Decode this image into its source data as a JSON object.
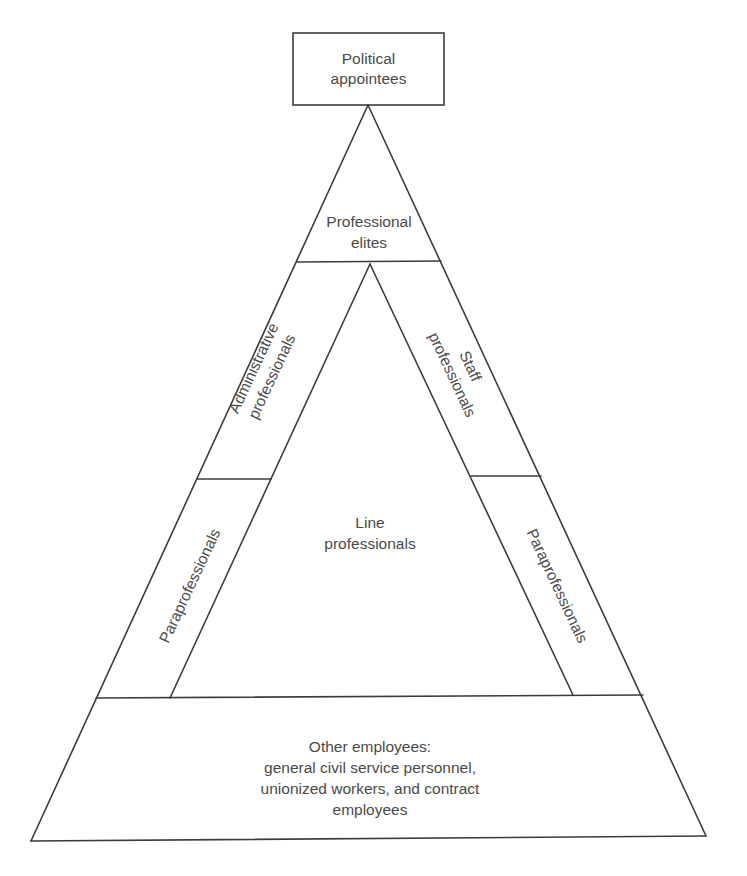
{
  "diagram": {
    "type": "hierarchy-pyramid",
    "colors": {
      "line": "#3c3c3c",
      "text": "#4a4a4a",
      "background": "#ffffff"
    },
    "top_box": {
      "lines": [
        "Political",
        "appointees"
      ]
    },
    "professional_elites": {
      "lines": [
        "Professional",
        "elites"
      ]
    },
    "administrative_professionals": {
      "lines": [
        "Administrative",
        "professionals"
      ]
    },
    "staff_professionals": {
      "lines": [
        "Staff",
        "professionals"
      ]
    },
    "left_paraprofessionals": {
      "label": "Paraprofessionals"
    },
    "right_paraprofessionals": {
      "label": "Paraprofessionals"
    },
    "line_professionals": {
      "lines": [
        "Line",
        "professionals"
      ]
    },
    "other_employees": {
      "lines": [
        "Other employees:",
        "general civil service personnel,",
        "unionized workers, and contract",
        "employees"
      ]
    }
  }
}
